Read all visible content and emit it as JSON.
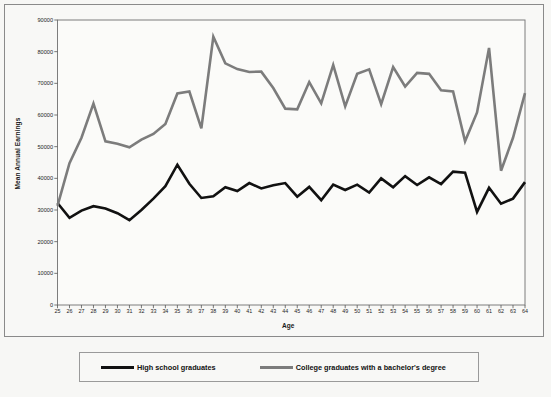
{
  "chart_data": {
    "type": "line",
    "title": "",
    "xlabel": "Age",
    "ylabel": "Mean Annual Earnings",
    "xlim": [
      25,
      64
    ],
    "ylim": [
      0,
      90000
    ],
    "grid": false,
    "legend_position": "bottom",
    "ytick_labels": [
      "90000",
      "80000",
      "70000",
      "60000",
      "50000",
      "40000",
      "30000",
      "20000",
      "10000",
      "0"
    ],
    "ytick_values": [
      90000,
      80000,
      70000,
      60000,
      50000,
      40000,
      30000,
      20000,
      10000,
      0
    ],
    "x": [
      25,
      26,
      27,
      28,
      29,
      30,
      31,
      32,
      33,
      34,
      35,
      36,
      37,
      38,
      39,
      40,
      41,
      42,
      43,
      44,
      45,
      46,
      47,
      48,
      49,
      50,
      51,
      52,
      53,
      54,
      55,
      56,
      57,
      58,
      59,
      60,
      61,
      62,
      63,
      64
    ],
    "xtick_labels": [
      "25",
      "26",
      "27",
      "28",
      "29",
      "30",
      "31",
      "32",
      "33",
      "34",
      "35",
      "36",
      "37",
      "38",
      "39",
      "40",
      "41",
      "42",
      "43",
      "44",
      "45",
      "46",
      "47",
      "48",
      "49",
      "50",
      "51",
      "52",
      "53",
      "54",
      "55",
      "56",
      "57",
      "58",
      "59",
      "60",
      "61",
      "62",
      "63",
      "64"
    ],
    "series": [
      {
        "name": "High school graduates",
        "color": "#111111",
        "width": 2.6,
        "values": [
          32200,
          27500,
          29800,
          31200,
          30500,
          29000,
          26800,
          30000,
          33600,
          37500,
          44300,
          38300,
          33800,
          34300,
          37200,
          36000,
          38500,
          36800,
          37800,
          38500,
          34200,
          37300,
          33100,
          38000,
          36300,
          38000,
          35500,
          40000,
          37200,
          40700,
          37900,
          40300,
          38200,
          42100,
          41800,
          29400,
          37000,
          32000,
          33600,
          38800
        ]
      },
      {
        "name": "College graduates with a bachelor's degree",
        "color": "#7c7c7c",
        "width": 2.6,
        "values": [
          31300,
          44800,
          52800,
          63600,
          51700,
          50900,
          49800,
          52200,
          54000,
          57200,
          66800,
          67400,
          55800,
          84700,
          76300,
          74500,
          73600,
          73700,
          68500,
          62000,
          61800,
          70400,
          63700,
          75800,
          62700,
          73000,
          74400,
          63400,
          75100,
          69000,
          73300,
          73000,
          67800,
          67400,
          51700,
          60800,
          81200,
          42400,
          52800,
          66900
        ]
      }
    ],
    "annotations": []
  },
  "legend": {
    "entries": [
      {
        "label": "High school graduates",
        "color": "#111111"
      },
      {
        "label": "College graduates with a bachelor's degree",
        "color": "#7c7c7c"
      }
    ]
  },
  "background_text": {
    "items": [
      {
        "text": "MARKET IN ECONOMY",
        "x": 150,
        "y": 1,
        "size": 17
      },
      {
        "text": "the determinants of earning in",
        "x": 88,
        "y": 28,
        "size": 12
      },
      {
        "text": "than in the field. The young and the",
        "x": 75,
        "y": 44,
        "size": 12
      },
      {
        "text": "workers in the workforce. In",
        "x": 98,
        "y": 60,
        "size": 12
      },
      {
        "text": "of earnings. The young workers",
        "x": 88,
        "y": 76,
        "size": 12
      },
      {
        "text": "less of them in the workplace",
        "x": 88,
        "y": 92,
        "size": 12
      },
      {
        "text": "are more skills than men and",
        "x": 92,
        "y": 108,
        "size": 12
      },
      {
        "text": "the earnings of the population",
        "x": 92,
        "y": 124,
        "size": 12
      },
      {
        "text": "there are",
        "x": 14,
        "y": 232,
        "size": 11
      },
      {
        "text": "earnings of",
        "x": 96,
        "y": 232,
        "size": 11
      },
      {
        "text": "the distribution",
        "x": 200,
        "y": 232,
        "size": 11
      },
      {
        "text": "of income in",
        "x": 320,
        "y": 232,
        "size": 11
      },
      {
        "text": "the country",
        "x": 430,
        "y": 232,
        "size": 11
      }
    ]
  }
}
